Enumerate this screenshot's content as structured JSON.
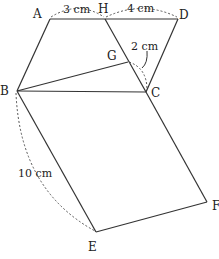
{
  "diagram": {
    "type": "geometry",
    "points": {
      "A": {
        "label": "A",
        "x": 50,
        "y": 19
      },
      "H": {
        "label": "H",
        "x": 105,
        "y": 19
      },
      "D": {
        "label": "D",
        "x": 178,
        "y": 19
      },
      "G": {
        "label": "G",
        "x": 128,
        "y": 62
      },
      "B": {
        "label": "B",
        "x": 17,
        "y": 91
      },
      "C": {
        "label": "C",
        "x": 146,
        "y": 92
      },
      "E": {
        "label": "E",
        "x": 96,
        "y": 232
      },
      "F": {
        "label": "F",
        "x": 207,
        "y": 202
      }
    },
    "segments": [
      [
        "A",
        "D"
      ],
      [
        "A",
        "B"
      ],
      [
        "D",
        "C"
      ],
      [
        "B",
        "C"
      ],
      [
        "H",
        "C"
      ],
      [
        "B",
        "G"
      ],
      [
        "B",
        "E"
      ],
      [
        "E",
        "F"
      ],
      [
        "F",
        "C"
      ]
    ],
    "measurements": {
      "AH": "3 cm",
      "HD": "4 cm",
      "GC": "2 cm",
      "BE": "10 cm"
    }
  }
}
